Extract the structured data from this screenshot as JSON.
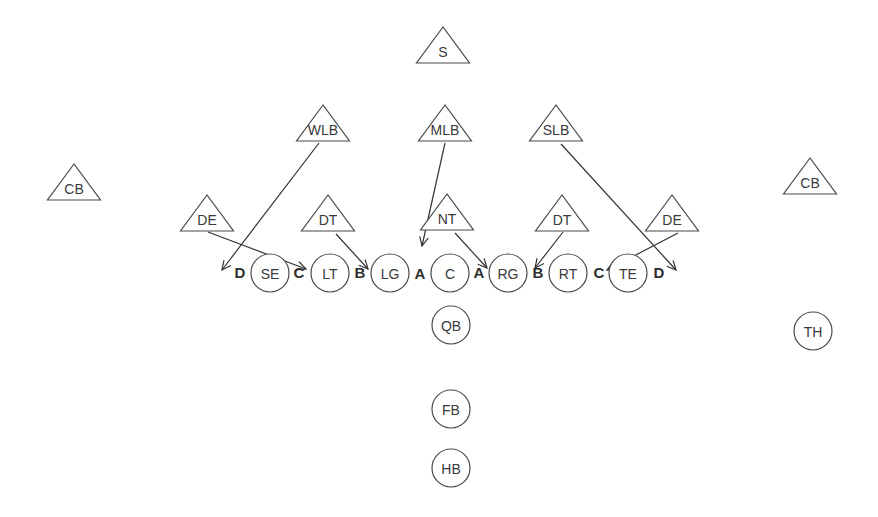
{
  "diagram": {
    "type": "football-formation",
    "colors": {
      "stroke": "#4a4a4a",
      "text": "#3a3a3a",
      "background": "#ffffff"
    },
    "defense": [
      {
        "id": "S",
        "label": "S",
        "x": 443,
        "y": 27
      },
      {
        "id": "WLB",
        "label": "WLB",
        "x": 323,
        "y": 105
      },
      {
        "id": "MLB",
        "label": "MLB",
        "x": 445,
        "y": 105
      },
      {
        "id": "SLB",
        "label": "SLB",
        "x": 556,
        "y": 105
      },
      {
        "id": "CB_L",
        "label": "CB",
        "x": 74,
        "y": 164
      },
      {
        "id": "CB_R",
        "label": "CB",
        "x": 810,
        "y": 158
      },
      {
        "id": "DE_L",
        "label": "DE",
        "x": 207,
        "y": 195
      },
      {
        "id": "DT_L",
        "label": "DT",
        "x": 328,
        "y": 195
      },
      {
        "id": "NT",
        "label": "NT",
        "x": 447,
        "y": 194
      },
      {
        "id": "DT_R",
        "label": "DT",
        "x": 562,
        "y": 195
      },
      {
        "id": "DE_R",
        "label": "DE",
        "x": 672,
        "y": 195
      }
    ],
    "offense": [
      {
        "id": "SE",
        "label": "SE",
        "x": 270,
        "y": 273
      },
      {
        "id": "LT",
        "label": "LT",
        "x": 330,
        "y": 273
      },
      {
        "id": "LG",
        "label": "LG",
        "x": 390,
        "y": 273
      },
      {
        "id": "C",
        "label": "C",
        "x": 450,
        "y": 273
      },
      {
        "id": "RG",
        "label": "RG",
        "x": 508,
        "y": 273
      },
      {
        "id": "RT",
        "label": "RT",
        "x": 568,
        "y": 273
      },
      {
        "id": "TE",
        "label": "TE",
        "x": 628,
        "y": 273
      },
      {
        "id": "QB",
        "label": "QB",
        "x": 451,
        "y": 325
      },
      {
        "id": "FB",
        "label": "FB",
        "x": 451,
        "y": 409
      },
      {
        "id": "HB",
        "label": "HB",
        "x": 451,
        "y": 468
      },
      {
        "id": "TH",
        "label": "TH",
        "x": 813,
        "y": 331
      }
    ],
    "gaps": [
      {
        "label": "D",
        "x": 240,
        "y": 272
      },
      {
        "label": "C",
        "x": 299,
        "y": 272
      },
      {
        "label": "B",
        "x": 360,
        "y": 272
      },
      {
        "label": "A",
        "x": 420,
        "y": 273
      },
      {
        "label": "A",
        "x": 479,
        "y": 272
      },
      {
        "label": "B",
        "x": 538,
        "y": 272
      },
      {
        "label": "C",
        "x": 599,
        "y": 272
      },
      {
        "label": "D",
        "x": 659,
        "y": 272
      }
    ],
    "routes": [
      {
        "from": "WLB",
        "x1": 319,
        "y1": 143,
        "x2": 222,
        "y2": 270
      },
      {
        "from": "DE_L",
        "x1": 208,
        "y1": 232,
        "x2": 306,
        "y2": 269
      },
      {
        "from": "DT_L",
        "x1": 336,
        "y1": 234,
        "x2": 368,
        "y2": 269
      },
      {
        "from": "MLB",
        "x1": 445,
        "y1": 143,
        "x2": 422,
        "y2": 246
      },
      {
        "from": "NT",
        "x1": 455,
        "y1": 233,
        "x2": 487,
        "y2": 268
      },
      {
        "from": "DT_R",
        "x1": 563,
        "y1": 232,
        "x2": 535,
        "y2": 268
      },
      {
        "from": "SLB",
        "x1": 561,
        "y1": 144,
        "x2": 676,
        "y2": 270
      },
      {
        "from": "DE_R",
        "x1": 678,
        "y1": 233,
        "x2": 607,
        "y2": 270
      }
    ]
  }
}
